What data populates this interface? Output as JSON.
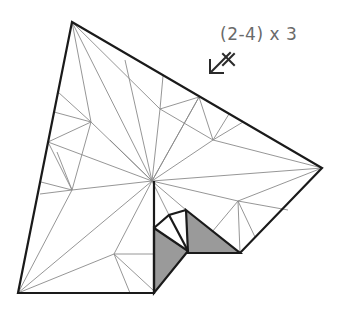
{
  "instruction": {
    "label": "(2-4) x 3",
    "arrow_icon": "arrow-down-left-with-cross-icon"
  },
  "diagram": {
    "colors": {
      "outline": "#1a1a1a",
      "crease": "#8a8a8a",
      "shade": "#9a9a9a",
      "label": "#6a6a6a"
    }
  }
}
